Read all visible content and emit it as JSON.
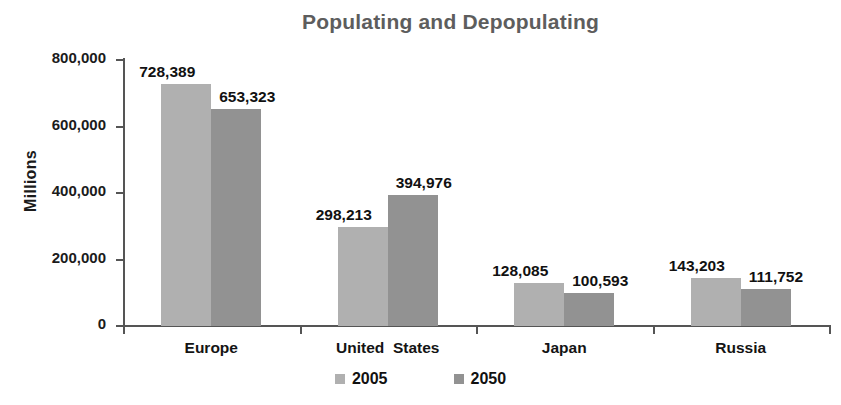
{
  "chart_data": {
    "type": "bar",
    "title": "Populating and Depopulating",
    "xlabel": "",
    "ylabel": "Millions",
    "ylim": [
      0,
      800000
    ],
    "ytick_labels": [
      "800,000",
      "600,000",
      "400,000",
      "200,000",
      "0"
    ],
    "ytick_values": [
      800000,
      600000,
      400000,
      200000,
      0
    ],
    "grid": false,
    "legend_position": "bottom",
    "categories": [
      "Europe",
      "United  States",
      "Japan",
      "Russia"
    ],
    "series": [
      {
        "name": "2005",
        "color": "#b0b0b0",
        "values": [
          728389,
          298213,
          128085,
          143203
        ],
        "value_labels": [
          "728,389",
          "298,213",
          "128,085",
          "143,203"
        ]
      },
      {
        "name": "2050",
        "color": "#929292",
        "values": [
          653323,
          394976,
          100593,
          111752
        ],
        "value_labels": [
          "653,323",
          "394,976",
          "100,593",
          "111,752"
        ]
      }
    ]
  },
  "legend": {
    "items": [
      {
        "label": "2005",
        "color": "#b0b0b0"
      },
      {
        "label": "2050",
        "color": "#929292"
      }
    ]
  },
  "colors": {
    "series_2005": "#b0b0b0",
    "series_2050": "#929292",
    "axis": "#555555",
    "title": "#5d5d5d",
    "text": "#111111",
    "background": "#ffffff"
  }
}
